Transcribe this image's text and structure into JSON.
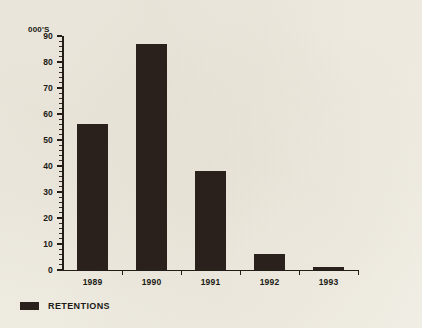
{
  "chart_data": {
    "type": "bar",
    "title": "",
    "subtitle": "",
    "xlabel": "",
    "ylabel": "000'S",
    "categories": [
      "1989",
      "1990",
      "1991",
      "1992",
      "1993"
    ],
    "values": [
      56,
      87,
      38,
      6,
      1
    ],
    "series": [
      {
        "name": "RETENTIONS",
        "values": [
          56,
          87,
          38,
          6,
          1
        ]
      }
    ],
    "ylim": [
      0,
      90
    ],
    "ytick_step": 10,
    "yticks": [
      0,
      10,
      20,
      30,
      40,
      50,
      60,
      70,
      80,
      90
    ],
    "ytick_labels": [
      "0",
      "10",
      "20",
      "30",
      "40",
      "50",
      "60",
      "70",
      "80",
      "90"
    ],
    "minor_tick_step": 2,
    "grid": false,
    "legend": {
      "position": "bottom-left",
      "entries": [
        {
          "label": "RETENTIONS",
          "color": "#2a211c"
        }
      ]
    },
    "colors": {
      "bar": "#2a211c",
      "axis": "#241c17",
      "text": "#201a15",
      "background": "#f2efe6"
    }
  }
}
